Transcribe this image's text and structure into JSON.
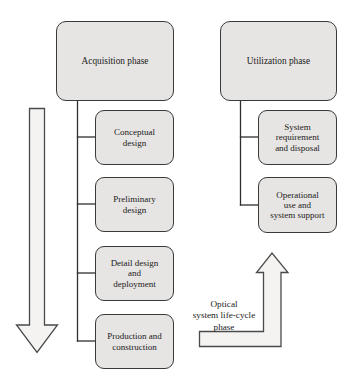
{
  "diagram": {
    "title": "Optical system life-cycle phase",
    "style": {
      "node_fill": "#e7e5e3",
      "node_stroke": "#3a3a3a",
      "arrow_fill": "#f2f1ef",
      "arrow_stroke": "#4a4a4a",
      "connector_stroke": "#2e2e2e",
      "background": "#ffffff",
      "text_color": "#1a1a1a"
    },
    "columns": [
      {
        "id": "acquisition",
        "phase": {
          "name": "acquisition-phase-box",
          "label": "Acquisition phase"
        },
        "steps": [
          {
            "name": "conceptual-design-box",
            "label": "Conceptual\ndesign"
          },
          {
            "name": "preliminary-design-box",
            "label": "Preliminary\ndesign"
          },
          {
            "name": "detail-design-box",
            "label": "Detail design\nand\ndeployment"
          },
          {
            "name": "production-construction-box",
            "label": "Production and\nconstruction"
          }
        ]
      },
      {
        "id": "utilization",
        "phase": {
          "name": "utilization-phase-box",
          "label": "Utilization phase"
        },
        "steps": [
          {
            "name": "system-requirement-box",
            "label": "System\nrequirement\nand disposal"
          },
          {
            "name": "operational-use-box",
            "label": "Operational\nuse and\nsystem support"
          }
        ]
      }
    ],
    "arrows": [
      {
        "name": "downward-progression-arrow",
        "direction": "down",
        "semantic": "time-progression"
      },
      {
        "name": "life-cycle-return-arrow",
        "direction": "up",
        "semantic": "life-cycle-feedback"
      }
    ],
    "caption": {
      "name": "life-cycle-caption",
      "label": "Optical\nsystem life-cycle\nphase"
    }
  }
}
